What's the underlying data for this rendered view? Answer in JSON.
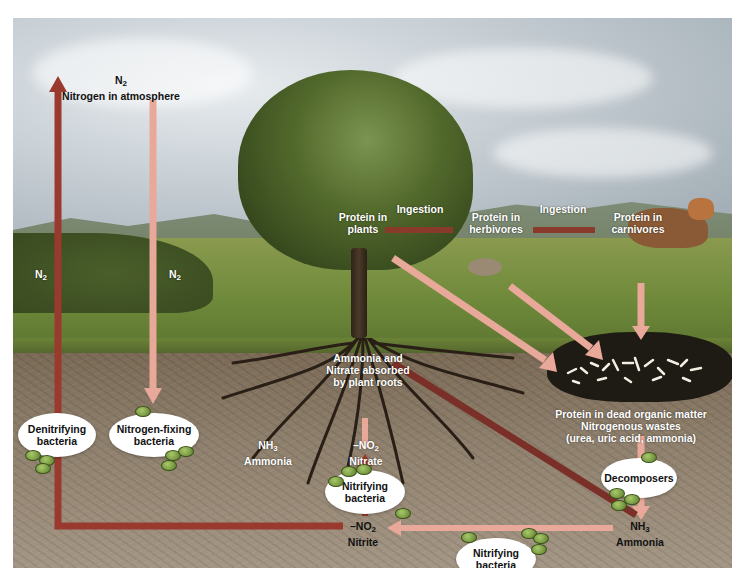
{
  "colors": {
    "denitrification_arrow": "#9a3a2e",
    "fixation_arrow": "#e8a89a",
    "decay_arrow": "#e8a89a",
    "ammonia_arrow": "#7a3028",
    "ingestion_arrow": "#8a3a2a",
    "nitrification_arrow": "#e8a89a",
    "bacteria_cell": "#6f9a3a",
    "bubble": "#ffffff"
  },
  "atmosphere": {
    "formula": "N",
    "subscript": "2",
    "label": "Nitrogen in atmosphere"
  },
  "arrow_labels": {
    "n2_left": {
      "formula": "N",
      "subscript": "2"
    },
    "n2_right": {
      "formula": "N",
      "subscript": "2"
    },
    "ingestion_1": "Ingestion",
    "ingestion_2": "Ingestion"
  },
  "nodes": {
    "protein_plants": [
      "Protein in",
      "plants"
    ],
    "protein_herbivores": [
      "Protein in",
      "herbivores"
    ],
    "protein_carnivores": [
      "Protein in",
      "carnivores"
    ],
    "absorbed": [
      "Ammonia and",
      "Nitrate absorbed",
      "by plant roots"
    ],
    "dead_matter": [
      "Protein in dead organic matter",
      "Nitrogenous wastes",
      "(urea, uric acid, ammonia)"
    ],
    "nh3_left": {
      "formula": "NH",
      "subscript": "3",
      "label": "Ammonia"
    },
    "nitrate": {
      "formula": "–NO",
      "subscript": "2",
      "label": "Nitrate"
    },
    "nitrite": {
      "formula": "–NO",
      "subscript": "2",
      "label": "Nitrite"
    },
    "nh3_right": {
      "formula": "NH",
      "subscript": "3",
      "label": "Ammonia"
    }
  },
  "bacteria": {
    "denitrifying": [
      "Denitrifying",
      "bacteria"
    ],
    "nitrogen_fixing": [
      "Nitrogen-fixing",
      "bacteria"
    ],
    "nitrifying_upper": [
      "Nitrifying",
      "bacteria"
    ],
    "nitrifying_lower": [
      "Nitrifying",
      "bacteria"
    ],
    "decomposers": [
      "Decomposers"
    ]
  }
}
